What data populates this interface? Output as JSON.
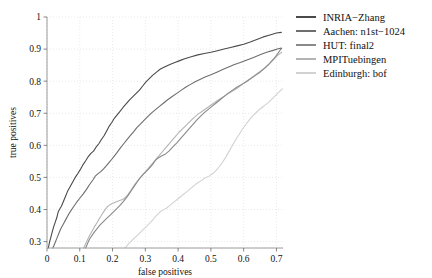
{
  "chart_data": {
    "type": "line",
    "title": "",
    "xlabel": "false positives",
    "ylabel": "true positives",
    "xlim": [
      0,
      0.72
    ],
    "ylim": [
      0.28,
      1.0
    ],
    "xticks": [
      "0",
      "0.1",
      "0.2",
      "0.3",
      "0.4",
      "0.5",
      "0.6",
      "0.7"
    ],
    "xtick_values": [
      0,
      0.1,
      0.2,
      0.3,
      0.4,
      0.5,
      0.6,
      0.7
    ],
    "yticks": [
      "0.3",
      "0.4",
      "0.5",
      "0.6",
      "0.7",
      "0.8",
      "0.9",
      "1"
    ],
    "ytick_values": [
      0.3,
      0.4,
      0.5,
      0.6,
      0.7,
      0.8,
      0.9,
      1.0
    ],
    "grid": true,
    "legend_position": "right",
    "series": [
      {
        "name": "INRIA−Zhang",
        "color": "#4a4a4a",
        "points": [
          [
            0.004,
            0.28
          ],
          [
            0.008,
            0.3
          ],
          [
            0.012,
            0.315
          ],
          [
            0.016,
            0.33
          ],
          [
            0.02,
            0.345
          ],
          [
            0.025,
            0.36
          ],
          [
            0.03,
            0.375
          ],
          [
            0.034,
            0.392
          ],
          [
            0.038,
            0.4
          ],
          [
            0.044,
            0.41
          ],
          [
            0.05,
            0.425
          ],
          [
            0.056,
            0.44
          ],
          [
            0.062,
            0.455
          ],
          [
            0.07,
            0.47
          ],
          [
            0.078,
            0.485
          ],
          [
            0.086,
            0.5
          ],
          [
            0.094,
            0.512
          ],
          [
            0.102,
            0.525
          ],
          [
            0.11,
            0.54
          ],
          [
            0.118,
            0.552
          ],
          [
            0.126,
            0.565
          ],
          [
            0.134,
            0.575
          ],
          [
            0.142,
            0.582
          ],
          [
            0.15,
            0.595
          ],
          [
            0.158,
            0.605
          ],
          [
            0.166,
            0.618
          ],
          [
            0.174,
            0.63
          ],
          [
            0.182,
            0.645
          ],
          [
            0.19,
            0.66
          ],
          [
            0.198,
            0.672
          ],
          [
            0.206,
            0.685
          ],
          [
            0.214,
            0.695
          ],
          [
            0.222,
            0.705
          ],
          [
            0.232,
            0.718
          ],
          [
            0.242,
            0.73
          ],
          [
            0.252,
            0.742
          ],
          [
            0.262,
            0.752
          ],
          [
            0.272,
            0.762
          ],
          [
            0.282,
            0.772
          ],
          [
            0.292,
            0.785
          ],
          [
            0.302,
            0.798
          ],
          [
            0.312,
            0.808
          ],
          [
            0.322,
            0.818
          ],
          [
            0.334,
            0.828
          ],
          [
            0.346,
            0.838
          ],
          [
            0.36,
            0.845
          ],
          [
            0.375,
            0.852
          ],
          [
            0.39,
            0.858
          ],
          [
            0.405,
            0.864
          ],
          [
            0.42,
            0.87
          ],
          [
            0.44,
            0.876
          ],
          [
            0.46,
            0.882
          ],
          [
            0.48,
            0.886
          ],
          [
            0.5,
            0.89
          ],
          [
            0.52,
            0.895
          ],
          [
            0.54,
            0.9
          ],
          [
            0.56,
            0.905
          ],
          [
            0.58,
            0.91
          ],
          [
            0.6,
            0.915
          ],
          [
            0.62,
            0.922
          ],
          [
            0.64,
            0.93
          ],
          [
            0.66,
            0.938
          ],
          [
            0.68,
            0.944
          ],
          [
            0.7,
            0.95
          ],
          [
            0.715,
            0.952
          ]
        ]
      },
      {
        "name": "Aachen: n1st−1024",
        "color": "#6e6e6e",
        "points": [
          [
            0.018,
            0.28
          ],
          [
            0.024,
            0.295
          ],
          [
            0.03,
            0.31
          ],
          [
            0.036,
            0.325
          ],
          [
            0.042,
            0.34
          ],
          [
            0.05,
            0.355
          ],
          [
            0.058,
            0.37
          ],
          [
            0.066,
            0.385
          ],
          [
            0.074,
            0.398
          ],
          [
            0.082,
            0.41
          ],
          [
            0.09,
            0.422
          ],
          [
            0.1,
            0.435
          ],
          [
            0.11,
            0.448
          ],
          [
            0.12,
            0.462
          ],
          [
            0.13,
            0.478
          ],
          [
            0.14,
            0.492
          ],
          [
            0.148,
            0.505
          ],
          [
            0.156,
            0.512
          ],
          [
            0.164,
            0.518
          ],
          [
            0.174,
            0.528
          ],
          [
            0.184,
            0.54
          ],
          [
            0.194,
            0.552
          ],
          [
            0.204,
            0.565
          ],
          [
            0.214,
            0.578
          ],
          [
            0.224,
            0.592
          ],
          [
            0.234,
            0.605
          ],
          [
            0.244,
            0.618
          ],
          [
            0.254,
            0.63
          ],
          [
            0.264,
            0.642
          ],
          [
            0.274,
            0.655
          ],
          [
            0.284,
            0.665
          ],
          [
            0.296,
            0.678
          ],
          [
            0.308,
            0.69
          ],
          [
            0.32,
            0.702
          ],
          [
            0.332,
            0.712
          ],
          [
            0.344,
            0.722
          ],
          [
            0.356,
            0.732
          ],
          [
            0.368,
            0.742
          ],
          [
            0.382,
            0.752
          ],
          [
            0.396,
            0.762
          ],
          [
            0.41,
            0.772
          ],
          [
            0.424,
            0.782
          ],
          [
            0.438,
            0.79
          ],
          [
            0.452,
            0.798
          ],
          [
            0.468,
            0.806
          ],
          [
            0.484,
            0.814
          ],
          [
            0.5,
            0.82
          ],
          [
            0.518,
            0.828
          ],
          [
            0.536,
            0.836
          ],
          [
            0.554,
            0.844
          ],
          [
            0.572,
            0.852
          ],
          [
            0.59,
            0.858
          ],
          [
            0.61,
            0.866
          ],
          [
            0.63,
            0.874
          ],
          [
            0.65,
            0.882
          ],
          [
            0.67,
            0.89
          ],
          [
            0.69,
            0.896
          ],
          [
            0.705,
            0.901
          ],
          [
            0.715,
            0.903
          ]
        ]
      },
      {
        "name": "HUT: final2",
        "color": "#8a8a8a",
        "points": [
          [
            0.118,
            0.28
          ],
          [
            0.124,
            0.295
          ],
          [
            0.13,
            0.308
          ],
          [
            0.138,
            0.32
          ],
          [
            0.146,
            0.332
          ],
          [
            0.154,
            0.342
          ],
          [
            0.162,
            0.352
          ],
          [
            0.172,
            0.362
          ],
          [
            0.182,
            0.372
          ],
          [
            0.192,
            0.382
          ],
          [
            0.202,
            0.392
          ],
          [
            0.212,
            0.402
          ],
          [
            0.222,
            0.412
          ],
          [
            0.232,
            0.424
          ],
          [
            0.242,
            0.436
          ],
          [
            0.25,
            0.448
          ],
          [
            0.258,
            0.46
          ],
          [
            0.266,
            0.472
          ],
          [
            0.274,
            0.484
          ],
          [
            0.282,
            0.496
          ],
          [
            0.292,
            0.508
          ],
          [
            0.302,
            0.518
          ],
          [
            0.312,
            0.528
          ],
          [
            0.322,
            0.54
          ],
          [
            0.33,
            0.552
          ],
          [
            0.338,
            0.56
          ],
          [
            0.348,
            0.566
          ],
          [
            0.36,
            0.572
          ],
          [
            0.372,
            0.582
          ],
          [
            0.384,
            0.595
          ],
          [
            0.396,
            0.608
          ],
          [
            0.408,
            0.622
          ],
          [
            0.42,
            0.636
          ],
          [
            0.432,
            0.65
          ],
          [
            0.444,
            0.664
          ],
          [
            0.456,
            0.678
          ],
          [
            0.468,
            0.69
          ],
          [
            0.48,
            0.702
          ],
          [
            0.492,
            0.712
          ],
          [
            0.504,
            0.722
          ],
          [
            0.516,
            0.732
          ],
          [
            0.528,
            0.742
          ],
          [
            0.54,
            0.752
          ],
          [
            0.552,
            0.762
          ],
          [
            0.566,
            0.772
          ],
          [
            0.58,
            0.782
          ],
          [
            0.594,
            0.79
          ],
          [
            0.608,
            0.798
          ],
          [
            0.622,
            0.808
          ],
          [
            0.636,
            0.818
          ],
          [
            0.65,
            0.828
          ],
          [
            0.664,
            0.84
          ],
          [
            0.678,
            0.854
          ],
          [
            0.692,
            0.87
          ],
          [
            0.704,
            0.886
          ],
          [
            0.712,
            0.898
          ],
          [
            0.716,
            0.902
          ]
        ]
      },
      {
        "name": "MPITuebingen",
        "color": "#b4b4b4",
        "points": [
          [
            0.112,
            0.28
          ],
          [
            0.12,
            0.298
          ],
          [
            0.128,
            0.315
          ],
          [
            0.136,
            0.33
          ],
          [
            0.144,
            0.345
          ],
          [
            0.152,
            0.358
          ],
          [
            0.16,
            0.372
          ],
          [
            0.168,
            0.385
          ],
          [
            0.176,
            0.398
          ],
          [
            0.184,
            0.408
          ],
          [
            0.192,
            0.415
          ],
          [
            0.202,
            0.42
          ],
          [
            0.212,
            0.424
          ],
          [
            0.222,
            0.428
          ],
          [
            0.232,
            0.432
          ],
          [
            0.24,
            0.438
          ],
          [
            0.248,
            0.448
          ],
          [
            0.256,
            0.46
          ],
          [
            0.264,
            0.472
          ],
          [
            0.272,
            0.484
          ],
          [
            0.282,
            0.496
          ],
          [
            0.292,
            0.508
          ],
          [
            0.302,
            0.52
          ],
          [
            0.312,
            0.532
          ],
          [
            0.322,
            0.544
          ],
          [
            0.332,
            0.556
          ],
          [
            0.342,
            0.568
          ],
          [
            0.352,
            0.58
          ],
          [
            0.362,
            0.592
          ],
          [
            0.372,
            0.604
          ],
          [
            0.382,
            0.616
          ],
          [
            0.392,
            0.628
          ],
          [
            0.402,
            0.64
          ],
          [
            0.414,
            0.652
          ],
          [
            0.426,
            0.664
          ],
          [
            0.438,
            0.676
          ],
          [
            0.45,
            0.688
          ],
          [
            0.462,
            0.698
          ],
          [
            0.476,
            0.708
          ],
          [
            0.49,
            0.718
          ],
          [
            0.504,
            0.728
          ],
          [
            0.518,
            0.738
          ],
          [
            0.532,
            0.748
          ],
          [
            0.548,
            0.758
          ],
          [
            0.564,
            0.768
          ],
          [
            0.58,
            0.778
          ],
          [
            0.596,
            0.79
          ],
          [
            0.612,
            0.802
          ],
          [
            0.628,
            0.814
          ],
          [
            0.644,
            0.826
          ],
          [
            0.66,
            0.838
          ],
          [
            0.676,
            0.852
          ],
          [
            0.692,
            0.868
          ],
          [
            0.705,
            0.882
          ],
          [
            0.716,
            0.89
          ]
        ]
      },
      {
        "name": "Edinburgh: bof",
        "color": "#d2d2d2",
        "points": [
          [
            0.238,
            0.28
          ],
          [
            0.248,
            0.292
          ],
          [
            0.258,
            0.302
          ],
          [
            0.268,
            0.312
          ],
          [
            0.278,
            0.322
          ],
          [
            0.288,
            0.332
          ],
          [
            0.298,
            0.342
          ],
          [
            0.308,
            0.352
          ],
          [
            0.318,
            0.362
          ],
          [
            0.326,
            0.372
          ],
          [
            0.334,
            0.382
          ],
          [
            0.344,
            0.392
          ],
          [
            0.354,
            0.398
          ],
          [
            0.364,
            0.404
          ],
          [
            0.374,
            0.412
          ],
          [
            0.386,
            0.422
          ],
          [
            0.398,
            0.432
          ],
          [
            0.41,
            0.442
          ],
          [
            0.422,
            0.452
          ],
          [
            0.434,
            0.462
          ],
          [
            0.446,
            0.472
          ],
          [
            0.458,
            0.482
          ],
          [
            0.47,
            0.49
          ],
          [
            0.482,
            0.498
          ],
          [
            0.494,
            0.504
          ],
          [
            0.506,
            0.512
          ],
          [
            0.516,
            0.522
          ],
          [
            0.526,
            0.534
          ],
          [
            0.536,
            0.548
          ],
          [
            0.546,
            0.564
          ],
          [
            0.556,
            0.582
          ],
          [
            0.566,
            0.6
          ],
          [
            0.576,
            0.618
          ],
          [
            0.586,
            0.634
          ],
          [
            0.596,
            0.65
          ],
          [
            0.606,
            0.664
          ],
          [
            0.616,
            0.678
          ],
          [
            0.626,
            0.69
          ],
          [
            0.636,
            0.7
          ],
          [
            0.646,
            0.71
          ],
          [
            0.656,
            0.718
          ],
          [
            0.666,
            0.726
          ],
          [
            0.676,
            0.734
          ],
          [
            0.686,
            0.744
          ],
          [
            0.696,
            0.754
          ],
          [
            0.706,
            0.764
          ],
          [
            0.714,
            0.772
          ],
          [
            0.718,
            0.776
          ]
        ]
      }
    ]
  },
  "legend": {
    "items": [
      {
        "label": "INRIA−Zhang",
        "color": "#4a4a4a"
      },
      {
        "label": "Aachen: n1st−1024",
        "color": "#6e6e6e"
      },
      {
        "label": "HUT: final2",
        "color": "#8a8a8a"
      },
      {
        "label": "MPITuebingen",
        "color": "#b4b4b4"
      },
      {
        "label": "Edinburgh: bof",
        "color": "#d2d2d2"
      }
    ]
  }
}
